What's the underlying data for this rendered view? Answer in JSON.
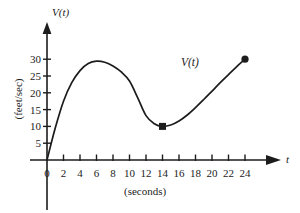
{
  "figure": {
    "background_color": "#ffffff",
    "ink_color": "#1c1c1c"
  },
  "axes": {
    "y_axis_title": "V(t)",
    "x_axis_title": "t",
    "y_unit_label": "(feet/sec)",
    "x_unit_label": "(seconds)",
    "origin_label": "0"
  },
  "curve_label": "V(t)",
  "chart_data": {
    "type": "line",
    "title": "",
    "subtitle": "",
    "xlabel": "(seconds)",
    "ylabel": "(feet/sec)",
    "x_axis_symbol": "t",
    "y_axis_symbol": "V(t)",
    "series_name": "V(t)",
    "xlim": [
      0,
      24
    ],
    "ylim": [
      0,
      32
    ],
    "grid": false,
    "legend": "none",
    "xticks": [
      0,
      2,
      4,
      6,
      8,
      10,
      12,
      14,
      16,
      18,
      20,
      22,
      24
    ],
    "xtick_labels": [
      "0",
      "2",
      "4",
      "6",
      "8",
      "10",
      "12",
      "14",
      "16",
      "18",
      "20",
      "22",
      "24"
    ],
    "yticks": [
      5,
      10,
      15,
      20,
      25,
      30
    ],
    "ytick_labels": [
      "5",
      "10",
      "15",
      "20",
      "25",
      "30"
    ],
    "x": [
      0,
      1,
      2,
      3,
      4,
      5,
      6,
      7,
      8,
      9,
      10,
      11,
      12,
      13,
      14,
      15,
      16,
      17,
      18,
      19,
      20,
      21,
      22,
      23,
      24
    ],
    "values": [
      0,
      9.5,
      17.5,
      23,
      26.6,
      28.7,
      29.4,
      29.1,
      28.0,
      26.2,
      23.5,
      18.5,
      13.2,
      10.8,
      10.0,
      10.4,
      11.6,
      13.4,
      15.6,
      18.0,
      20.5,
      23.0,
      25.4,
      27.8,
      30.0
    ],
    "markers": [
      {
        "x": 14,
        "y": 10,
        "shape": "square",
        "label": "local-minimum"
      },
      {
        "x": 24,
        "y": 30,
        "shape": "circle",
        "label": "right-endpoint"
      }
    ],
    "annotations": [
      {
        "text": "V(t)",
        "x": 18,
        "y": 24.5
      }
    ]
  }
}
